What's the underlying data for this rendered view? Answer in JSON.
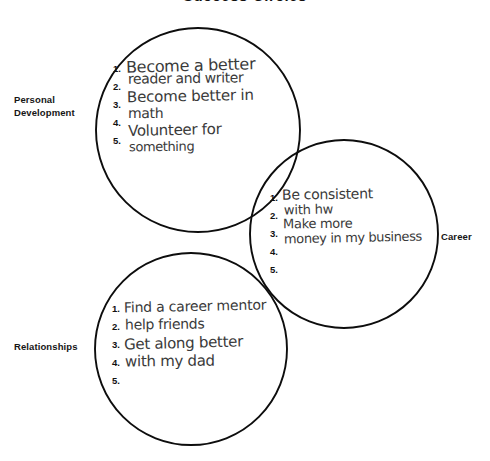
{
  "document": {
    "title": "Success Circles",
    "background_color": "#ffffff",
    "ink_color": "#3a3a3a",
    "print_color": "#111111"
  },
  "circles": [
    {
      "id": "personal-development",
      "label": "Personal Development",
      "label_lines": [
        "Personal",
        "Development"
      ],
      "cx": 198,
      "cy": 130,
      "r": 102,
      "numbers": [
        "1.",
        "2.",
        "3.",
        "4.",
        "5."
      ],
      "handwriting": [
        "Become a better",
        "reader and writer",
        "Become better in",
        "math",
        "Volunteer for",
        "something"
      ],
      "entries": [
        "Become a better reader and writer",
        "Become better in math",
        "Volunteer for something",
        "",
        ""
      ]
    },
    {
      "id": "career",
      "label": "Career",
      "label_lines": [
        "Career"
      ],
      "cx": 344,
      "cy": 234,
      "r": 94,
      "numbers": [
        "1.",
        "2.",
        "3.",
        "4.",
        "5."
      ],
      "handwriting": [
        "Be consistent",
        "with hw",
        "Make more",
        "money in my business"
      ],
      "entries": [
        "Be consistent with hw",
        "Make more money in my business",
        "",
        "",
        ""
      ]
    },
    {
      "id": "relationships",
      "label": "Relationships",
      "label_lines": [
        "Relationships"
      ],
      "cx": 191,
      "cy": 349,
      "r": 96,
      "numbers": [
        "1.",
        "2.",
        "3.",
        "4.",
        "5."
      ],
      "handwriting": [
        "Find a career mentor",
        "help friends",
        "Get along better",
        "with my dad"
      ],
      "entries": [
        "Find a career mentor",
        "help friends",
        "Get along better with my dad",
        "",
        ""
      ]
    }
  ]
}
